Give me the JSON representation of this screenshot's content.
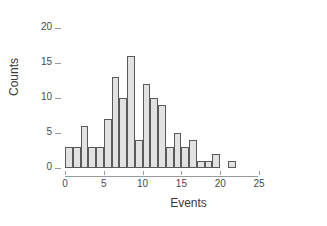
{
  "chart_data": {
    "type": "bar",
    "title": "",
    "subtitle": "",
    "xlabel": "Events",
    "ylabel": "Counts",
    "xlim": [
      0,
      25
    ],
    "ylim": [
      0,
      20
    ],
    "xticks": [
      0,
      5,
      10,
      15,
      20,
      25
    ],
    "yticks": [
      0,
      5,
      10,
      15,
      20
    ],
    "xtick_labels": [
      "0",
      "5",
      "10",
      "15",
      "20",
      "25"
    ],
    "ytick_labels": [
      "0",
      "5",
      "10",
      "15",
      "20"
    ],
    "grid": false,
    "legend": null,
    "bin_width": 1,
    "bin_starts": [
      0,
      1,
      2,
      3,
      4,
      5,
      6,
      7,
      8,
      9,
      10,
      11,
      12,
      13,
      14,
      15,
      16,
      17,
      18,
      19,
      20,
      21
    ],
    "categories": [
      "0-1",
      "1-2",
      "2-3",
      "3-4",
      "4-5",
      "5-6",
      "6-7",
      "7-8",
      "8-9",
      "9-10",
      "10-11",
      "11-12",
      "12-13",
      "13-14",
      "14-15",
      "15-16",
      "16-17",
      "17-18",
      "18-19",
      "19-20",
      "20-21",
      "21-22"
    ],
    "values": [
      3,
      3,
      6,
      3,
      3,
      7,
      13,
      10,
      16,
      4,
      12,
      10,
      9,
      3,
      5,
      3,
      4,
      1,
      1,
      2,
      0,
      1
    ],
    "bar_fill_color": "#e2e2e2",
    "bar_border_color": "#5a5a5a",
    "axis_color": "#9a9a9a",
    "text_color": "#3a3a3a",
    "background_color": "#ffffff"
  }
}
